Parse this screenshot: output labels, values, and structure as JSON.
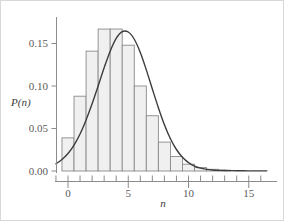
{
  "chart_data": {
    "type": "bar",
    "title": "",
    "subtitle": "",
    "xlabel": "n",
    "ylabel": "P(n)",
    "xlim": [
      -1,
      16.5
    ],
    "ylim": [
      0,
      0.182
    ],
    "grid": false,
    "legend": null,
    "annotations": [],
    "x_ticks": [
      0,
      5,
      10,
      15
    ],
    "x_tick_labels": [
      "0",
      "5",
      "10",
      "15"
    ],
    "x_minor_ticks": [
      -1,
      0,
      1,
      2,
      3,
      4,
      5,
      6,
      7,
      8,
      9,
      10,
      11,
      12,
      13,
      14,
      15,
      16
    ],
    "y_ticks": [
      0.0,
      0.05,
      0.1,
      0.15
    ],
    "y_tick_labels": [
      "0.00",
      "0.05",
      "0.10",
      "0.15"
    ],
    "categories": [
      0,
      1,
      2,
      3,
      4,
      5,
      6,
      7,
      8,
      9,
      10,
      11,
      12,
      13,
      14,
      15,
      16
    ],
    "values": [
      0.039,
      0.088,
      0.141,
      0.167,
      0.167,
      0.148,
      0.1,
      0.065,
      0.034,
      0.017,
      0.008,
      0.004,
      0.002,
      0.001,
      0.0,
      0.0,
      0.0
    ],
    "bar_width": 1,
    "bar_fill": "#f0f0f0",
    "bar_stroke": "#8a8a8a",
    "series": [
      {
        "name": "histogram",
        "type": "bar",
        "values": [
          0.039,
          0.088,
          0.141,
          0.167,
          0.167,
          0.148,
          0.1,
          0.065,
          0.034,
          0.017,
          0.008,
          0.004,
          0.002,
          0.001,
          0.0,
          0.0,
          0.0
        ]
      },
      {
        "name": "fitted-curve",
        "type": "line",
        "color": "#3d3d3d",
        "x": [
          -1.0,
          -0.5,
          0.0,
          0.5,
          1.0,
          1.5,
          2.0,
          2.5,
          3.0,
          3.5,
          4.0,
          4.5,
          5.0,
          5.5,
          6.0,
          6.5,
          7.0,
          7.5,
          8.0,
          8.5,
          9.0,
          9.5,
          10.0,
          10.5,
          11.0,
          11.5,
          12.0,
          12.5,
          13.0,
          13.5,
          14.0,
          14.5,
          15.0,
          15.5,
          16.0,
          16.5
        ],
        "y": [
          0.0085,
          0.0135,
          0.0205,
          0.0305,
          0.0435,
          0.06,
          0.079,
          0.1,
          0.1215,
          0.141,
          0.156,
          0.164,
          0.1635,
          0.155,
          0.1395,
          0.119,
          0.0965,
          0.0745,
          0.0545,
          0.038,
          0.0253,
          0.0161,
          0.0098,
          0.0058,
          0.0033,
          0.0019,
          0.0011,
          0.0007,
          0.0005,
          0.0004,
          0.0003,
          0.0003,
          0.0002,
          0.0002,
          0.0002,
          0.0002
        ]
      }
    ]
  },
  "axes": {
    "x_label": "n",
    "y_label": "P(n)"
  }
}
